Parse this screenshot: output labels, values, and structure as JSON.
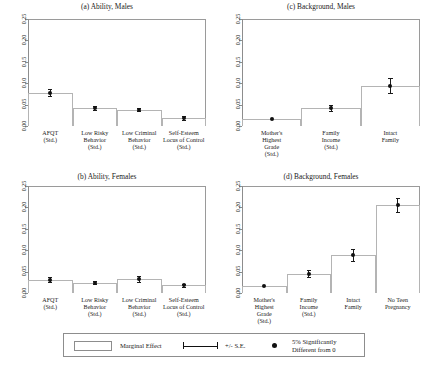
{
  "figure": {
    "axis_ticks": [
      "0.00",
      "0.05",
      "0.10",
      "0.15",
      "0.20",
      "0.25"
    ],
    "ylim": [
      0.0,
      0.25
    ]
  },
  "legend": {
    "marginal_effect": "Marginal Effect",
    "se": "+/- S.E.",
    "sig_line1": "5% Significantly",
    "sig_line2": "Different from 0"
  },
  "chart_data": [
    {
      "type": "bar",
      "panel": "a",
      "title": "(a) Ability, Males",
      "categories": [
        "AFQT\n(Std.)",
        "Low Risky\nBehavior\n(Std.)",
        "Low Criminal\nBehavior\n(Std.)",
        "Self-Esteem\nLocus of Control\n(Std.)"
      ],
      "category_lines": [
        [
          "AFQT",
          "(Std.)"
        ],
        [
          "Low Risky",
          "Behavior",
          "(Std.)"
        ],
        [
          "Low Criminal",
          "Behavior",
          "(Std.)"
        ],
        [
          "Self-Esteem",
          "Locus of Control",
          "(Std.)"
        ]
      ],
      "values": [
        0.078,
        0.042,
        0.038,
        0.019
      ],
      "errors": [
        0.008,
        0.005,
        0.004,
        0.005
      ],
      "significant": [
        true,
        true,
        true,
        true
      ],
      "xlabel": "",
      "ylabel": "",
      "ylim": [
        0.0,
        0.25
      ],
      "grid": false
    },
    {
      "type": "bar",
      "panel": "b",
      "title": "(b) Ability, Females",
      "categories": [
        "AFQT\n(Std.)",
        "Low Risky\nBehavior\n(Std.)",
        "Low Criminal\nBehavior\n(Std.)",
        "Self-Esteem\nLocus of Control\n(Std.)"
      ],
      "category_lines": [
        [
          "AFQT",
          "(Std.)"
        ],
        [
          "Low Risky",
          "Behavior",
          "(Std.)"
        ],
        [
          "Low Criminal",
          "Behavior",
          "(Std.)"
        ],
        [
          "Self-Esteem",
          "Locus of Control",
          "(Std.)"
        ]
      ],
      "values": [
        0.031,
        0.024,
        0.033,
        0.018
      ],
      "errors": [
        0.006,
        0.004,
        0.007,
        0.004
      ],
      "significant": [
        true,
        true,
        true,
        true
      ],
      "xlabel": "",
      "ylabel": "",
      "ylim": [
        0.0,
        0.25
      ],
      "grid": false
    },
    {
      "type": "bar",
      "panel": "c",
      "title": "(c) Background, Males",
      "categories": [
        "Mother's\nHighest\nGrade\n(Std.)",
        "Family\nIncome\n(Std.)",
        "Intact\nFamily"
      ],
      "category_lines": [
        [
          "Mother's",
          "Highest",
          "Grade",
          "(Std.)"
        ],
        [
          "Family",
          "Income",
          "(Std.)"
        ],
        [
          "Intact",
          "Family"
        ]
      ],
      "values": [
        0.017,
        0.042,
        0.094
      ],
      "errors": [
        0.002,
        0.007,
        0.017
      ],
      "significant": [
        true,
        true,
        true
      ],
      "xlabel": "",
      "ylabel": "",
      "ylim": [
        0.0,
        0.25
      ],
      "grid": false
    },
    {
      "type": "bar",
      "panel": "d",
      "title": "(d) Background, Females",
      "categories": [
        "Mother's\nHighest\nGrade\n(Std.)",
        "Family\nIncome\n(Std.)",
        "Intact\nFamily",
        "No Teen\nPregnancy"
      ],
      "category_lines": [
        [
          "Mother's",
          "Highest",
          "Grade",
          "(Std.)"
        ],
        [
          "Family",
          "Income",
          "(Std.)"
        ],
        [
          "Intact",
          "Family"
        ],
        [
          "No Teen",
          "Pregnancy"
        ]
      ],
      "values": [
        0.017,
        0.045,
        0.089,
        0.205
      ],
      "errors": [
        0.002,
        0.008,
        0.014,
        0.016
      ],
      "significant": [
        true,
        true,
        true,
        true
      ],
      "xlabel": "",
      "ylabel": "",
      "ylim": [
        0.0,
        0.25
      ],
      "grid": false
    }
  ]
}
